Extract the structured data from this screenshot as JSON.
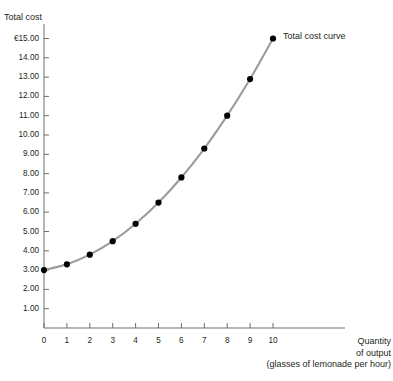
{
  "chart_data": {
    "type": "line",
    "title": "",
    "subtitle": "",
    "ylabel": "Total cost",
    "xlabel": "Quantity of output (glasses of lemonade per hour)",
    "xlabel_lines": [
      "Quantity",
      "of output",
      "(glasses of lemonade per hour)"
    ],
    "x": [
      0,
      1,
      2,
      3,
      4,
      5,
      6,
      7,
      8,
      9,
      10
    ],
    "values": [
      3.0,
      3.3,
      3.8,
      4.5,
      5.4,
      6.5,
      7.8,
      9.3,
      11.0,
      12.9,
      15.0
    ],
    "series": [
      {
        "name": "Total cost curve",
        "values": [
          3.0,
          3.3,
          3.8,
          4.5,
          5.4,
          6.5,
          7.8,
          9.3,
          11.0,
          12.9,
          15.0
        ]
      }
    ],
    "annotations": [
      {
        "text": "Total cost curve",
        "x": 10,
        "y": 15.0
      }
    ],
    "legend": [
      "Total cost curve"
    ],
    "legend_position": "inline-right-of-last-point",
    "xlim": [
      0,
      10
    ],
    "ylim": [
      0,
      15
    ],
    "xticks": [
      "0",
      "1",
      "2",
      "3",
      "4",
      "5",
      "6",
      "7",
      "8",
      "9",
      "10"
    ],
    "yticks": [
      "1.00",
      "2.00",
      "3.00",
      "4.00",
      "5.00",
      "6.00",
      "7.00",
      "8.00",
      "9.00",
      "10.00",
      "11.00",
      "12.00",
      "13.00",
      "14.00",
      "€15.00"
    ],
    "ytick_values": [
      1,
      2,
      3,
      4,
      5,
      6,
      7,
      8,
      9,
      10,
      11,
      12,
      13,
      14,
      15
    ],
    "currency_symbol": "€",
    "grid": false,
    "colors": {
      "line": "#9b9b9b",
      "marker": "#000000",
      "axis": "#6e6e6e",
      "text": "#231f20",
      "background": "#ffffff"
    }
  }
}
